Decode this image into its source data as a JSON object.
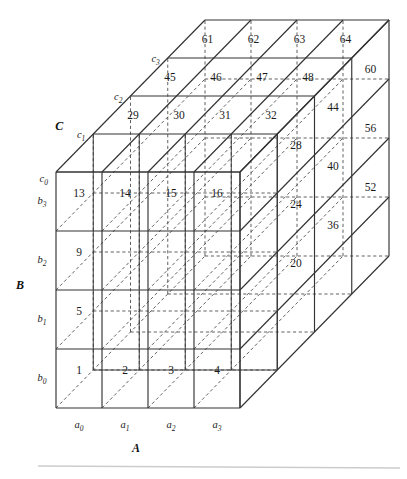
{
  "figure": {
    "type": "3d-cube-diagram",
    "background": "#ffffff",
    "line_color": "#333333",
    "hidden_line_color": "#444444",
    "rule_color": "#cccccc"
  },
  "axes": {
    "a": {
      "name": "A",
      "ticks": [
        "a0",
        "a1",
        "a2",
        "a3"
      ]
    },
    "b": {
      "name": "B",
      "ticks": [
        "b0",
        "b1",
        "b2",
        "b3"
      ]
    },
    "c": {
      "name": "C",
      "ticks": [
        "c0",
        "c1",
        "c2",
        "c3"
      ]
    }
  },
  "faces": {
    "front": {
      "name": "front-face",
      "rows": [
        {
          "b": "b3",
          "cells": [
            "13",
            "14",
            "15",
            "16"
          ]
        },
        {
          "b": "b2",
          "cells": [
            "9",
            "",
            "",
            ""
          ]
        },
        {
          "b": "b1",
          "cells": [
            "5",
            "",
            "",
            ""
          ]
        },
        {
          "b": "b0",
          "cells": [
            "1",
            "2",
            "3",
            "4"
          ]
        }
      ]
    },
    "top": {
      "name": "top-face",
      "rows": [
        {
          "c": "c3",
          "cells": [
            "61",
            "62",
            "63",
            "64"
          ]
        },
        {
          "c": "c2",
          "cells": [
            "45",
            "46",
            "47",
            "48"
          ]
        },
        {
          "c": "c1",
          "cells": [
            "29",
            "30",
            "31",
            "32"
          ]
        },
        {
          "c": "c0",
          "cells": [
            "",
            "",
            "",
            ""
          ]
        }
      ]
    },
    "right": {
      "name": "right-face",
      "columns": [
        {
          "c": "c1",
          "cells": [
            "20",
            "24",
            "28"
          ]
        },
        {
          "c": "c2",
          "cells": [
            "36",
            "40",
            "44"
          ]
        },
        {
          "c": "c3",
          "cells": [
            "52",
            "56",
            "60"
          ]
        }
      ]
    }
  },
  "chart_data": {
    "type": "table",
    "xlabel": "A",
    "ylabel": "B",
    "zlabel": "C",
    "dim_a": [
      "a0",
      "a1",
      "a2",
      "a3"
    ],
    "dim_b": [
      "b0",
      "b1",
      "b2",
      "b3"
    ],
    "dim_c": [
      "c0",
      "c1",
      "c2",
      "c3"
    ],
    "visible_front_face": {
      "axis_rows": "B (b3 top to b0 bottom)",
      "axis_cols": "A (a0..a3)",
      "values": [
        [
          "13",
          "14",
          "15",
          "16"
        ],
        [
          "9",
          "",
          "",
          ""
        ],
        [
          "5",
          "",
          "",
          ""
        ],
        [
          "1",
          "2",
          "3",
          "4"
        ]
      ]
    },
    "visible_top_face": {
      "axis_rows": "C (c3 back to c0 front)",
      "axis_cols": "A (a0..a3)",
      "values": [
        [
          "61",
          "62",
          "63",
          "64"
        ],
        [
          "45",
          "46",
          "47",
          "48"
        ],
        [
          "29",
          "30",
          "31",
          "32"
        ],
        [
          "",
          "",
          "",
          ""
        ]
      ]
    },
    "visible_right_face": {
      "axis_rows": "B (b3 top to b1 bottom)",
      "axis_cols": "C (c1..c3)",
      "values": [
        [
          "28",
          "44",
          "60"
        ],
        [
          "24",
          "40",
          "56"
        ],
        [
          "20",
          "36",
          "52"
        ]
      ]
    }
  }
}
